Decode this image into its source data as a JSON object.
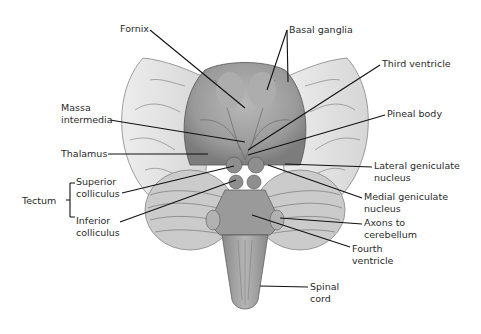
{
  "diagram": {
    "labels": {
      "fornix": "Fornix",
      "basal_ganglia": "Basal ganglia",
      "third_ventricle": "Third ventricle",
      "massa_intermedia_1": "Massa",
      "massa_intermedia_2": "intermedia",
      "pineal_body": "Pineal body",
      "thalamus": "Thalamus",
      "lateral_geniculate_1": "Lateral geniculate",
      "lateral_geniculate_2": "nucleus",
      "tectum": "Tectum",
      "superior_colliculus_1": "Superior",
      "superior_colliculus_2": "colliculus",
      "medial_geniculate_1": "Medial geniculate",
      "medial_geniculate_2": "nucleus",
      "inferior_colliculus_1": "Inferior",
      "inferior_colliculus_2": "colliculus",
      "axons_cerebellum_1": "Axons to",
      "axons_cerebellum_2": "cerebellum",
      "fourth_ventricle_1": "Fourth",
      "fourth_ventricle_2": "ventricle",
      "spinal_cord_1": "Spinal",
      "spinal_cord_2": "cord"
    },
    "colors": {
      "structure_gray": "#9a9a9a",
      "hemisphere_light": "#e2e2e2",
      "cerebellum": "#c8c8c8",
      "leader_line": "#111111",
      "text": "#2a2a2a"
    }
  }
}
